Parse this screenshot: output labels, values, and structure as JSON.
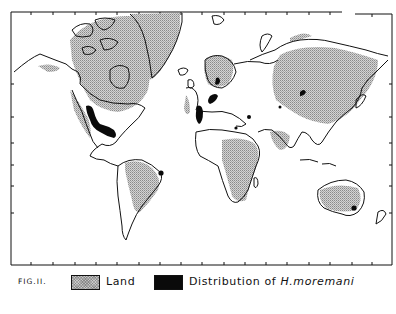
{
  "figure": {
    "label": "FIG.II."
  },
  "legend": {
    "items": [
      {
        "swatch": "stippled-gray",
        "label": "Land"
      },
      {
        "swatch": "solid-black",
        "label_prefix": "Distribution of ",
        "label_species": "H.moremani"
      }
    ]
  },
  "map": {
    "projection": "Mercator-like world map",
    "colors": {
      "land_fill": "#c9c9c9",
      "distribution_fill": "#0a0a0a",
      "coastline": "#111111",
      "background": "#ffffff"
    },
    "distribution_regions": [
      "Southern United States (band from Rockies to Gulf coast)",
      "Western Europe (France/Iberia)",
      "Central Europe (Germany/Low Countries)",
      "Scandinavia (southern Sweden)",
      "Black Sea region",
      "Levant / eastern Mediterranean",
      "Central Asia (small spots)",
      "Eastern Brazil",
      "Southeastern Australia"
    ]
  }
}
